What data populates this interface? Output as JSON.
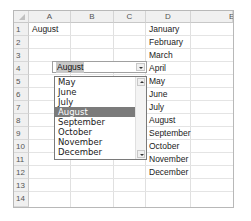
{
  "spreadsheet": {
    "columns": [
      "A",
      "B",
      "C",
      "D",
      "E"
    ],
    "rows": [
      "1",
      "2",
      "3",
      "4",
      "5",
      "6",
      "7",
      "8",
      "9",
      "10",
      "11",
      "12",
      "13",
      "14"
    ],
    "cells": {
      "A1": "August",
      "D": [
        "January",
        "February",
        "March",
        "April",
        "May",
        "June",
        "July",
        "August",
        "September",
        "October",
        "November",
        "December"
      ]
    }
  },
  "combobox": {
    "value": "August",
    "dropdown_icon": "chevron-down-icon",
    "options_visible": [
      "May",
      "June",
      "July",
      "August",
      "September",
      "October",
      "November",
      "December"
    ],
    "selected_index": 3,
    "scroll_up_icon": "chevron-up-icon",
    "scroll_down_icon": "chevron-down-icon"
  }
}
